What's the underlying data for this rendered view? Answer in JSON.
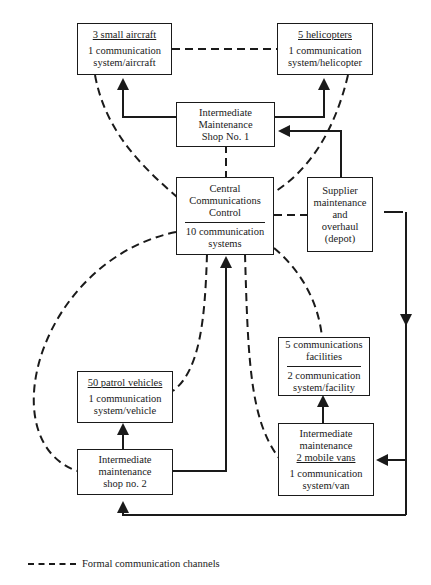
{
  "nodes": {
    "aircraft": {
      "title": "3 small aircraft",
      "line1": "1 communication",
      "line2": "system/aircraft"
    },
    "helicopters": {
      "title": "5 helicopters",
      "line1": "1 communication",
      "line2": "system/helicopter"
    },
    "ims1": {
      "line1": "Intermediate",
      "line2": "Maintenance",
      "line3": "Shop No. 1"
    },
    "central": {
      "line1": "Central",
      "line2": "Communications",
      "line3": "Control",
      "line4": "10 communication",
      "line5": "systems"
    },
    "supplier": {
      "line1": "Supplier",
      "line2": "maintenance",
      "line3": "and",
      "line4": "overhaul",
      "line5": "(depot)"
    },
    "facilities": {
      "line1": "5 communications",
      "line2": "facilities",
      "line3": "2 communication",
      "line4": "system/facility"
    },
    "patrol": {
      "title": "50 patrol vehicles",
      "line1": "1 communication",
      "line2": "system/vehicle"
    },
    "ims2": {
      "line1": "Intermediate",
      "line2": "maintenance",
      "line3": "shop  no. 2"
    },
    "vans": {
      "line1": "Intermediate",
      "line2": "maintenance",
      "line3": "2 mobile vans",
      "line4": "1 communication",
      "line5": "system/van"
    }
  },
  "legend": {
    "dashed_label": "Formal communication channels"
  },
  "colors": {
    "ink": "#1a1a1a",
    "background": "#ffffff"
  }
}
